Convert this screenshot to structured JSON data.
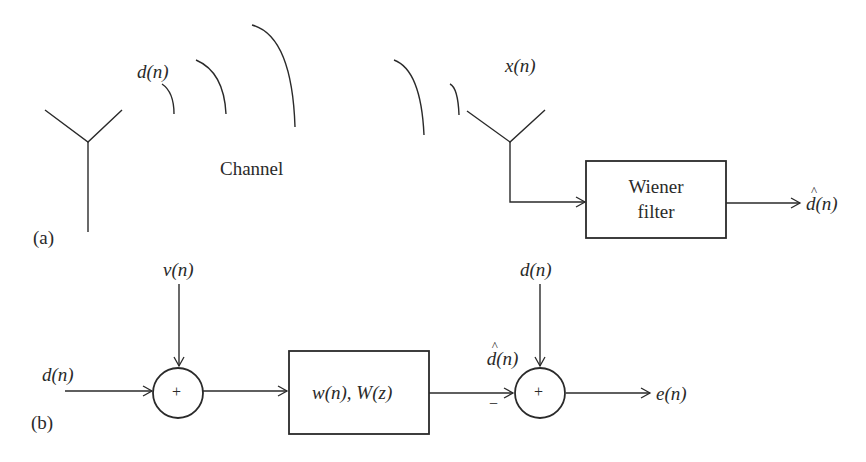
{
  "figure": {
    "panel_a": {
      "tag": "(a)",
      "transmitted_signal": "d(n)",
      "channel_label": "Channel",
      "received_signal": "x(n)",
      "filter_block": {
        "line1": "Wiener",
        "line2": "filter"
      },
      "output": "d(n)",
      "output_has_hat": true
    },
    "panel_b": {
      "tag": "(b)",
      "input": "d(n)",
      "noise": "v(n)",
      "adder1_sign": "+",
      "filter_block": "w(n), W(z)",
      "filter_output": "d(n)",
      "filter_output_has_hat": true,
      "minus_sign": "−",
      "reference": "d(n)",
      "adder2_sign": "+",
      "error": "e(n)"
    }
  },
  "colors": {
    "stroke": "#2a2a2a",
    "background": "#ffffff"
  }
}
